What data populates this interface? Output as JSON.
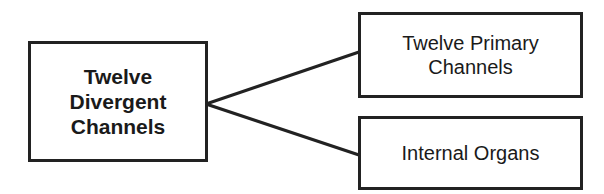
{
  "diagram": {
    "source": {
      "label": "Twelve\nDivergent\nChannels"
    },
    "targets": [
      {
        "label": "Twelve Primary\nChannels"
      },
      {
        "label": "Internal Organs"
      }
    ],
    "colors": {
      "stroke": "#222222",
      "background": "#ffffff",
      "text": "#1a1a1a"
    }
  }
}
